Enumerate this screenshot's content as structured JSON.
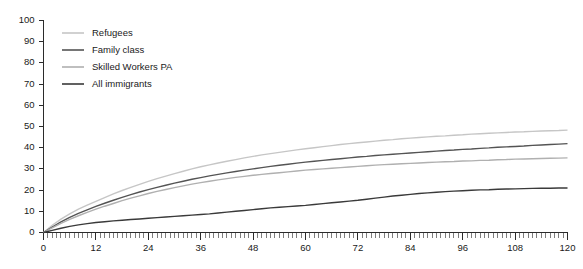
{
  "chart_data": {
    "type": "line",
    "title": "",
    "subtitle": "",
    "xlabel": "",
    "ylabel": "",
    "xlim": [
      0,
      120
    ],
    "ylim": [
      0,
      100
    ],
    "grid": false,
    "legend_position": "top-left-inside",
    "y_ticks": [
      0,
      10,
      20,
      30,
      40,
      50,
      60,
      70,
      80,
      90,
      100
    ],
    "x_ticks": [
      0,
      12,
      24,
      36,
      48,
      60,
      72,
      84,
      96,
      108,
      120
    ],
    "x_minor_tick_step": 1,
    "x": [
      0,
      2,
      4,
      6,
      8,
      10,
      12,
      14,
      16,
      18,
      20,
      22,
      24,
      26,
      28,
      30,
      32,
      34,
      36,
      38,
      40,
      42,
      44,
      46,
      48,
      50,
      52,
      54,
      56,
      58,
      60,
      62,
      64,
      66,
      68,
      70,
      72,
      74,
      76,
      78,
      80,
      82,
      84,
      86,
      88,
      90,
      92,
      94,
      96,
      98,
      100,
      102,
      104,
      106,
      108,
      110,
      112,
      114,
      116,
      118,
      120
    ],
    "series": [
      {
        "name": "Refugees",
        "color": "#c6c6c6",
        "values": [
          0.0,
          3.4,
          6.3,
          8.8,
          11.0,
          12.9,
          14.7,
          16.5,
          18.2,
          19.8,
          21.3,
          22.7,
          24.1,
          25.4,
          26.6,
          27.8,
          28.9,
          30.0,
          31.0,
          31.9,
          32.8,
          33.6,
          34.4,
          35.2,
          35.9,
          36.6,
          37.2,
          37.8,
          38.4,
          39.0,
          39.5,
          40.0,
          40.5,
          41.0,
          41.5,
          41.9,
          42.3,
          42.7,
          43.1,
          43.5,
          43.8,
          44.2,
          44.5,
          44.8,
          45.1,
          45.4,
          45.6,
          45.9,
          46.1,
          46.4,
          46.6,
          46.8,
          47.0,
          47.2,
          47.4,
          47.5,
          47.7,
          47.9,
          48.0,
          48.1,
          48.3
        ]
      },
      {
        "name": "Family class",
        "color": "#545454",
        "values": [
          0.0,
          2.6,
          5.0,
          7.1,
          9.0,
          10.7,
          12.3,
          13.8,
          15.2,
          16.6,
          17.9,
          19.1,
          20.2,
          21.3,
          22.3,
          23.3,
          24.2,
          25.1,
          25.9,
          26.7,
          27.4,
          28.1,
          28.8,
          29.4,
          30.0,
          30.6,
          31.2,
          31.7,
          32.2,
          32.7,
          33.2,
          33.6,
          34.0,
          34.4,
          34.8,
          35.2,
          35.6,
          35.9,
          36.3,
          36.6,
          36.9,
          37.2,
          37.5,
          37.8,
          38.1,
          38.4,
          38.7,
          38.9,
          39.2,
          39.4,
          39.7,
          39.9,
          40.2,
          40.4,
          40.6,
          40.8,
          41.1,
          41.3,
          41.5,
          41.7,
          41.9
        ]
      },
      {
        "name": "Skilled Workers PA",
        "color": "#b0b0b0",
        "values": [
          0.0,
          2.2,
          4.3,
          6.2,
          7.9,
          9.5,
          11.0,
          12.4,
          13.7,
          15.0,
          16.2,
          17.3,
          18.4,
          19.4,
          20.3,
          21.2,
          22.0,
          22.8,
          23.5,
          24.2,
          24.8,
          25.4,
          26.0,
          26.5,
          27.0,
          27.4,
          27.8,
          28.2,
          28.6,
          29.0,
          29.4,
          29.7,
          30.0,
          30.3,
          30.6,
          30.9,
          31.2,
          31.5,
          31.8,
          32.0,
          32.2,
          32.4,
          32.6,
          32.8,
          33.0,
          33.2,
          33.4,
          33.5,
          33.7,
          33.8,
          34.0,
          34.1,
          34.3,
          34.4,
          34.6,
          34.7,
          34.8,
          34.9,
          35.0,
          35.1,
          35.2
        ]
      },
      {
        "name": "All immigrants",
        "color": "#3a3a3a",
        "values": [
          0.0,
          1.0,
          2.0,
          2.9,
          3.6,
          4.2,
          4.7,
          5.1,
          5.5,
          5.8,
          6.1,
          6.4,
          6.7,
          7.0,
          7.3,
          7.6,
          7.9,
          8.2,
          8.5,
          8.8,
          9.2,
          9.6,
          10.0,
          10.4,
          10.8,
          11.2,
          11.6,
          11.9,
          12.2,
          12.5,
          12.8,
          13.2,
          13.6,
          14.0,
          14.4,
          14.8,
          15.2,
          15.7,
          16.2,
          16.7,
          17.2,
          17.6,
          18.0,
          18.4,
          18.7,
          19.0,
          19.3,
          19.5,
          19.7,
          19.9,
          20.1,
          20.2,
          20.4,
          20.5,
          20.6,
          20.7,
          20.8,
          20.9,
          20.9,
          21.0,
          21.0
        ]
      }
    ]
  },
  "legend": {
    "entries": [
      {
        "label": "Refugees"
      },
      {
        "label": "Family class"
      },
      {
        "label": "Skilled Workers PA"
      },
      {
        "label": "All immigrants"
      }
    ]
  },
  "axes": {
    "y_tick_labels": [
      "100",
      "90",
      "80",
      "70",
      "60",
      "50",
      "40",
      "30",
      "20",
      "10",
      "0"
    ],
    "x_tick_labels": [
      "0",
      "12",
      "24",
      "36",
      "48",
      "60",
      "72",
      "84",
      "96",
      "108",
      "120"
    ]
  },
  "colors": {
    "axis": "#2b2b2b",
    "minor_tick": "#7d7d7d",
    "text": "#1a1a1a",
    "background": "#ffffff"
  }
}
